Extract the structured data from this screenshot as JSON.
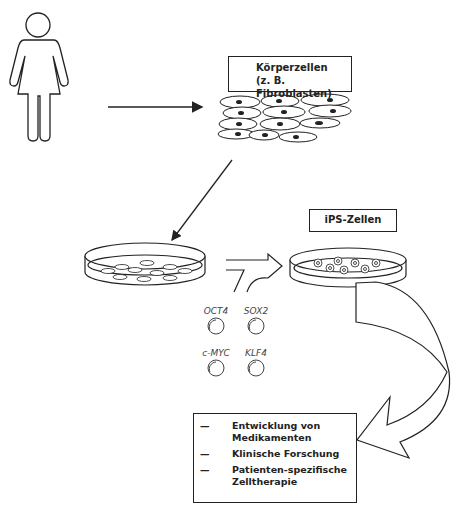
{
  "labels": {
    "somatic_cells_line1": "Körperzellen",
    "somatic_cells_line2": "(z. B. Fibroblasten)",
    "ips_cells": "iPS-Zellen"
  },
  "factors": [
    "OCT4",
    "SOX2",
    "c-MYC",
    "KLF4"
  ],
  "applications": {
    "bullet": "—",
    "items": [
      "Entwicklung von Medikamenten",
      "Klinische Forschung",
      "Patienten-spezifische Zelltherapie"
    ]
  }
}
